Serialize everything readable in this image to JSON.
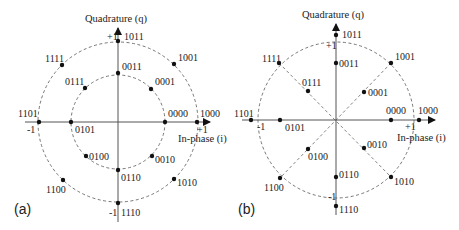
{
  "figure": {
    "panels": [
      {
        "id": "a",
        "label": "(a)",
        "y_axis_label": "Quadrature (q)",
        "x_axis_label": "In-phase (i)",
        "ticks": {
          "plus_x": "+1",
          "minus_x": "-1",
          "plus_y": "+1",
          "minus_y": "-1"
        },
        "rings": [
          "inner",
          "outer"
        ],
        "spokes": false,
        "points": [
          {
            "code": "0000",
            "ring": "inner",
            "angle_deg": 0
          },
          {
            "code": "0001",
            "ring": "inner",
            "angle_deg": 45
          },
          {
            "code": "0011",
            "ring": "inner",
            "angle_deg": 90
          },
          {
            "code": "0111",
            "ring": "inner",
            "angle_deg": 135
          },
          {
            "code": "0101",
            "ring": "inner",
            "angle_deg": 180
          },
          {
            "code": "0100",
            "ring": "inner",
            "angle_deg": 225
          },
          {
            "code": "0110",
            "ring": "inner",
            "angle_deg": 270
          },
          {
            "code": "0010",
            "ring": "inner",
            "angle_deg": 315
          },
          {
            "code": "1000",
            "ring": "outer",
            "angle_deg": 0
          },
          {
            "code": "1001",
            "ring": "outer",
            "angle_deg": 45
          },
          {
            "code": "1011",
            "ring": "outer",
            "angle_deg": 90
          },
          {
            "code": "1111",
            "ring": "outer",
            "angle_deg": 135
          },
          {
            "code": "1101",
            "ring": "outer",
            "angle_deg": 180
          },
          {
            "code": "1100",
            "ring": "outer",
            "angle_deg": 225
          },
          {
            "code": "1110",
            "ring": "outer",
            "angle_deg": 270
          },
          {
            "code": "1010",
            "ring": "outer",
            "angle_deg": 315
          }
        ]
      },
      {
        "id": "b",
        "label": "(b)",
        "y_axis_label": "Quadrature (q)",
        "x_axis_label": "In-phase (i)",
        "ticks": {
          "plus_x": "+1",
          "minus_x": "-1",
          "plus_y": "+1",
          "minus_y": "-1"
        },
        "rings": [
          "unit"
        ],
        "spokes": true,
        "points": [
          {
            "code": "0000",
            "angle_deg": 0
          },
          {
            "code": "0001",
            "angle_deg": 45
          },
          {
            "code": "0011",
            "angle_deg": 90
          },
          {
            "code": "0111",
            "angle_deg": 135
          },
          {
            "code": "0101",
            "angle_deg": 180
          },
          {
            "code": "0100",
            "angle_deg": 225
          },
          {
            "code": "0110",
            "angle_deg": 270
          },
          {
            "code": "0010",
            "angle_deg": 315
          },
          {
            "code": "1000",
            "angle_deg": 0
          },
          {
            "code": "1001",
            "angle_deg": 45
          },
          {
            "code": "1011",
            "angle_deg": 90
          },
          {
            "code": "1111",
            "angle_deg": 135
          },
          {
            "code": "1101",
            "angle_deg": 180
          },
          {
            "code": "1100",
            "angle_deg": 225
          },
          {
            "code": "1110",
            "angle_deg": 270
          },
          {
            "code": "1010",
            "angle_deg": 315
          }
        ]
      }
    ]
  }
}
